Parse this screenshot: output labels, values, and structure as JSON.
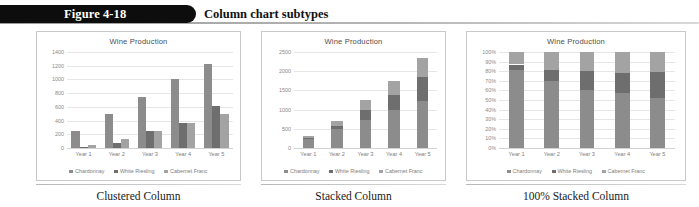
{
  "figure": {
    "number": "Figure 4-18",
    "title": "Column chart subtypes"
  },
  "colors": {
    "chardonnay": "#8c8c8c",
    "white_riesling": "#6e6e6e",
    "cabernet_franc": "#a3a3a3",
    "tab": "#0d0d0d",
    "grid": "#e6e6e6"
  },
  "panels": [
    {
      "caption": "Clustered Column"
    },
    {
      "caption": "Stacked Column"
    },
    {
      "caption": "100% Stacked Column"
    }
  ],
  "chart_data": [
    {
      "type": "bar",
      "subtype": "clustered",
      "title": "Wine Production",
      "xlabel": "",
      "ylabel": "",
      "categories": [
        "Year 1",
        "Year 2",
        "Year 3",
        "Year 4",
        "Year 5"
      ],
      "series": [
        {
          "name": "Chardonnay",
          "values": [
            250,
            500,
            740,
            1000,
            1230
          ]
        },
        {
          "name": "White Riesling",
          "values": [
            20,
            80,
            250,
            370,
            620
          ]
        },
        {
          "name": "Cabernet Franc",
          "values": [
            40,
            130,
            250,
            370,
            500
          ]
        }
      ],
      "yticks": [
        0,
        200,
        400,
        600,
        800,
        1000,
        1200,
        1400
      ],
      "ylim": [
        0,
        1400
      ],
      "grid": true,
      "legend": "bottom"
    },
    {
      "type": "bar",
      "subtype": "stacked",
      "title": "Wine Production",
      "xlabel": "",
      "ylabel": "",
      "categories": [
        "Year 1",
        "Year 2",
        "Year 3",
        "Year 4",
        "Year 5"
      ],
      "series": [
        {
          "name": "Chardonnay",
          "values": [
            250,
            500,
            740,
            1000,
            1230
          ]
        },
        {
          "name": "White Riesling",
          "values": [
            20,
            80,
            250,
            370,
            620
          ]
        },
        {
          "name": "Cabernet Franc",
          "values": [
            40,
            130,
            250,
            370,
            500
          ]
        }
      ],
      "totals": [
        310,
        710,
        1240,
        1740,
        2350
      ],
      "yticks": [
        0,
        500,
        1000,
        1500,
        2000,
        2500
      ],
      "ylim": [
        0,
        2500
      ],
      "grid": true,
      "legend": "bottom"
    },
    {
      "type": "bar",
      "subtype": "100-stacked",
      "title": "Wine Production",
      "xlabel": "",
      "ylabel": "",
      "categories": [
        "Year 1",
        "Year 2",
        "Year 3",
        "Year 4",
        "Year 5"
      ],
      "series": [
        {
          "name": "Chardonnay",
          "values": [
            81,
            70,
            60,
            57,
            52
          ]
        },
        {
          "name": "White Riesling",
          "values": [
            6,
            11,
            20,
            21,
            27
          ]
        },
        {
          "name": "Cabernet Franc",
          "values": [
            13,
            19,
            20,
            22,
            21
          ]
        }
      ],
      "yticks": [
        "0%",
        "10%",
        "20%",
        "30%",
        "40%",
        "50%",
        "60%",
        "70%",
        "80%",
        "90%",
        "100%"
      ],
      "ylim": [
        0,
        100
      ],
      "grid": true,
      "legend": "bottom"
    }
  ]
}
